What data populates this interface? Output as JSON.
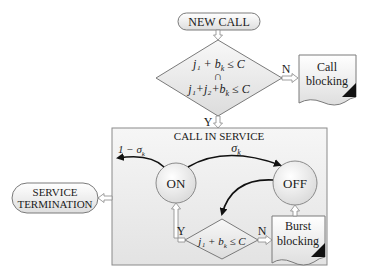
{
  "diagram": {
    "new_call": {
      "label": "NEW CALL"
    },
    "admission_check": {
      "line1": "j₁ + b",
      "line1_sub": "k",
      "line1_tail": " ≤ C",
      "operator": "∩",
      "line2": "j₁+j₂+b",
      "line2_sub": "k",
      "line2_tail": " ≤ C",
      "no_label": "N",
      "yes_label": "Y"
    },
    "call_blocking": {
      "line1": "Call",
      "line2": "blocking"
    },
    "call_in_service": {
      "title": "CALL IN SERVICE",
      "on_state": "ON",
      "off_state": "OFF",
      "on_exit_label": "1 − σ",
      "on_exit_sub": "k",
      "on_to_off_label": "σ",
      "on_to_off_sub": "k",
      "burst_check": {
        "expr": "j₁ + b",
        "expr_sub": "k",
        "expr_tail": " ≤ C",
        "yes_label": "Y",
        "no_label": "N"
      },
      "burst_blocking": {
        "line1": "Burst",
        "line2": "blocking"
      }
    },
    "service_termination": {
      "line1": "SERVICE",
      "line2": "TERMINATION"
    },
    "colors": {
      "stroke": "#7a7a7a",
      "fill_light": "#f4f4f4",
      "fill_mid": "#e2e2e2",
      "arrow_black": "#111111",
      "box_fill": "#ececec"
    }
  }
}
